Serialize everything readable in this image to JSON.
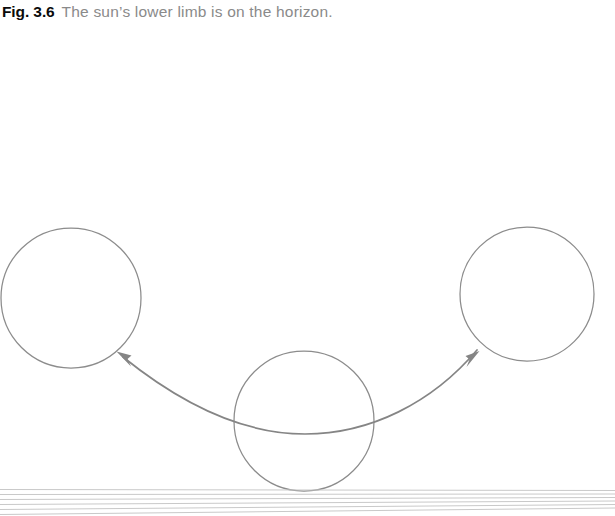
{
  "figure": {
    "caption_label": "Fig. 3.6",
    "caption_text": "The sun’s lower limb is on the horizon.",
    "colors": {
      "caption_label": "#0b0b0b",
      "caption_text": "#8a8a8a",
      "circle_stroke": "#8c8c8c",
      "arc_stroke": "#858585",
      "horizon_stroke": "#c9c9c9",
      "background": "#ffffff"
    }
  },
  "chart_data": {
    "type": "diagram",
    "title": "The sun’s lower limb is on the horizon.",
    "suns": [
      {
        "name": "sun-left",
        "cx": 71,
        "cy": 298,
        "r": 70,
        "label": "setting-position-left"
      },
      {
        "name": "sun-middle",
        "cx": 304,
        "cy": 421,
        "r": 70,
        "label": "lower-limb-on-horizon"
      },
      {
        "name": "sun-right",
        "cx": 527,
        "cy": 294,
        "r": 67,
        "label": "rising-position-right"
      }
    ],
    "motion_arc": {
      "name": "apparent-motion-arc",
      "path": "M 121 356 Q 300 452 476 349",
      "arrowheads": [
        {
          "name": "arrowhead-left",
          "x": 117,
          "y": 352,
          "direction": "up-left"
        },
        {
          "name": "arrowhead-right",
          "x": 479,
          "y": 352,
          "direction": "up-right"
        }
      ]
    },
    "horizon": {
      "name": "horizon-lines",
      "count": 6,
      "y_left": [
        489.5,
        494.5,
        499.5,
        504.5,
        509.5,
        514.5
      ],
      "y_right": [
        490.5,
        494.0,
        497.5,
        501.0,
        504.5,
        508.0
      ],
      "x_start": 0,
      "x_end": 615
    }
  }
}
